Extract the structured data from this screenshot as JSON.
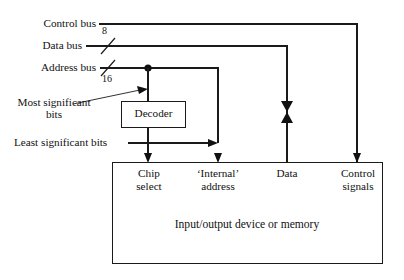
{
  "diagram": {
    "buses": [
      {
        "id": "control-bus",
        "label": "Control bus",
        "width_label": ""
      },
      {
        "id": "data-bus",
        "label": "Data bus",
        "width_label": "8"
      },
      {
        "id": "address-bus",
        "label": "Address bus",
        "width_label": "16"
      }
    ],
    "annotations": {
      "most_significant_bits": "Most significant\nbits",
      "most_significant_bits_line1": "Most significant",
      "most_significant_bits_line2": "bits",
      "least_significant_bits": "Least significant bits"
    },
    "decoder": {
      "label": "Decoder"
    },
    "device": {
      "label": "Input/output device or memory",
      "ports": [
        {
          "id": "chip-select",
          "line1": "Chip",
          "line2": "select"
        },
        {
          "id": "internal-address",
          "line1": "‘Internal’",
          "line2": "address"
        },
        {
          "id": "data",
          "line1": "Data",
          "line2": ""
        },
        {
          "id": "control-signals",
          "line1": "Control",
          "line2": "signals"
        }
      ]
    },
    "colors": {
      "line": "#1a1a1a",
      "text": "#111111",
      "background": "#ffffff"
    }
  }
}
